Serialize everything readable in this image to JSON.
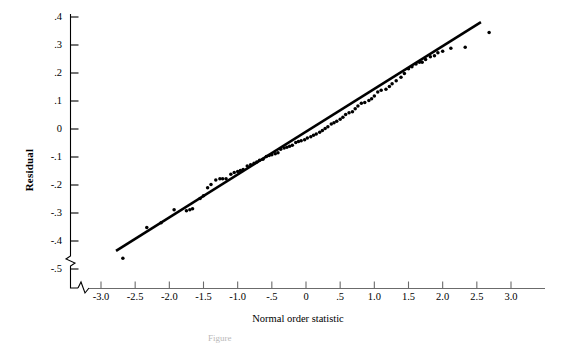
{
  "figure": {
    "ylabel": "Residual",
    "xlabel": "Normal order statistic",
    "caption": "Figure"
  },
  "chart_data": {
    "type": "scatter",
    "title": "",
    "xlabel": "Normal order statistic",
    "ylabel": "Residual",
    "xlim": [
      -3.15,
      3.0
    ],
    "ylim": [
      -0.55,
      0.45
    ],
    "xticks": [
      "-3.0",
      "-2.5",
      "-2.0",
      "-1.5",
      "-1.0",
      "-.5",
      "0",
      ".5",
      "1.0",
      "1.5",
      "2.0",
      "2.5",
      "3.0"
    ],
    "xtick_values": [
      -3.0,
      -2.5,
      -2.0,
      -1.5,
      -1.0,
      -0.5,
      0,
      0.5,
      1.0,
      1.5,
      2.0,
      2.5,
      3.0
    ],
    "yticks": [
      ".4",
      ".3",
      ".2",
      ".1",
      "0",
      "-.1",
      "-.2",
      "-.3",
      "-.4",
      "-.5"
    ],
    "ytick_values": [
      0.4,
      0.3,
      0.2,
      0.1,
      0,
      -0.1,
      -0.2,
      -0.3,
      -0.4,
      -0.5
    ],
    "grid": false,
    "legend": false,
    "axis_break_x": true,
    "axis_break_y": true,
    "marker": "filled-circle",
    "marker_color": "#000000",
    "reference_line": {
      "label": "fitted normal probability line",
      "color": "#000000",
      "x_start": -2.78,
      "y_start": -0.435,
      "x_end": 2.56,
      "y_end": 0.382
    },
    "points": [
      {
        "x": -2.68,
        "y": -0.462
      },
      {
        "x": -2.33,
        "y": -0.352
      },
      {
        "x": -2.12,
        "y": -0.335
      },
      {
        "x": -1.93,
        "y": -0.288
      },
      {
        "x": -1.75,
        "y": -0.292
      },
      {
        "x": -1.7,
        "y": -0.288
      },
      {
        "x": -1.66,
        "y": -0.285
      },
      {
        "x": -1.55,
        "y": -0.248
      },
      {
        "x": -1.5,
        "y": -0.238
      },
      {
        "x": -1.44,
        "y": -0.21
      },
      {
        "x": -1.39,
        "y": -0.198
      },
      {
        "x": -1.32,
        "y": -0.182
      },
      {
        "x": -1.26,
        "y": -0.178
      },
      {
        "x": -1.22,
        "y": -0.178
      },
      {
        "x": -1.17,
        "y": -0.178
      },
      {
        "x": -1.1,
        "y": -0.162
      },
      {
        "x": -1.05,
        "y": -0.155
      },
      {
        "x": -1.0,
        "y": -0.152
      },
      {
        "x": -0.96,
        "y": -0.148
      },
      {
        "x": -0.92,
        "y": -0.145
      },
      {
        "x": -0.86,
        "y": -0.132
      },
      {
        "x": -0.81,
        "y": -0.128
      },
      {
        "x": -0.76,
        "y": -0.122
      },
      {
        "x": -0.72,
        "y": -0.118
      },
      {
        "x": -0.68,
        "y": -0.112
      },
      {
        "x": -0.63,
        "y": -0.108
      },
      {
        "x": -0.58,
        "y": -0.098
      },
      {
        "x": -0.54,
        "y": -0.095
      },
      {
        "x": -0.5,
        "y": -0.092
      },
      {
        "x": -0.45,
        "y": -0.088
      },
      {
        "x": -0.41,
        "y": -0.085
      },
      {
        "x": -0.37,
        "y": -0.072
      },
      {
        "x": -0.32,
        "y": -0.068
      },
      {
        "x": -0.28,
        "y": -0.065
      },
      {
        "x": -0.24,
        "y": -0.062
      },
      {
        "x": -0.2,
        "y": -0.058
      },
      {
        "x": -0.15,
        "y": -0.048
      },
      {
        "x": -0.11,
        "y": -0.045
      },
      {
        "x": -0.07,
        "y": -0.042
      },
      {
        "x": -0.02,
        "y": -0.038
      },
      {
        "x": 0.02,
        "y": -0.032
      },
      {
        "x": 0.07,
        "y": -0.028
      },
      {
        "x": 0.11,
        "y": -0.022
      },
      {
        "x": 0.15,
        "y": -0.018
      },
      {
        "x": 0.2,
        "y": -0.012
      },
      {
        "x": 0.24,
        "y": -0.005
      },
      {
        "x": 0.28,
        "y": 0.002
      },
      {
        "x": 0.32,
        "y": 0.008
      },
      {
        "x": 0.37,
        "y": 0.018
      },
      {
        "x": 0.41,
        "y": 0.022
      },
      {
        "x": 0.45,
        "y": 0.028
      },
      {
        "x": 0.5,
        "y": 0.035
      },
      {
        "x": 0.54,
        "y": 0.042
      },
      {
        "x": 0.58,
        "y": 0.052
      },
      {
        "x": 0.63,
        "y": 0.058
      },
      {
        "x": 0.68,
        "y": 0.062
      },
      {
        "x": 0.72,
        "y": 0.072
      },
      {
        "x": 0.76,
        "y": 0.082
      },
      {
        "x": 0.81,
        "y": 0.092
      },
      {
        "x": 0.86,
        "y": 0.095
      },
      {
        "x": 0.92,
        "y": 0.102
      },
      {
        "x": 0.96,
        "y": 0.108
      },
      {
        "x": 1.0,
        "y": 0.118
      },
      {
        "x": 1.05,
        "y": 0.132
      },
      {
        "x": 1.1,
        "y": 0.138
      },
      {
        "x": 1.17,
        "y": 0.142
      },
      {
        "x": 1.22,
        "y": 0.152
      },
      {
        "x": 1.26,
        "y": 0.162
      },
      {
        "x": 1.32,
        "y": 0.172
      },
      {
        "x": 1.39,
        "y": 0.185
      },
      {
        "x": 1.44,
        "y": 0.198
      },
      {
        "x": 1.5,
        "y": 0.215
      },
      {
        "x": 1.55,
        "y": 0.222
      },
      {
        "x": 1.61,
        "y": 0.232
      },
      {
        "x": 1.66,
        "y": 0.238
      },
      {
        "x": 1.7,
        "y": 0.238
      },
      {
        "x": 1.75,
        "y": 0.248
      },
      {
        "x": 1.82,
        "y": 0.258
      },
      {
        "x": 1.88,
        "y": 0.262
      },
      {
        "x": 1.93,
        "y": 0.272
      },
      {
        "x": 2.0,
        "y": 0.278
      },
      {
        "x": 2.12,
        "y": 0.288
      },
      {
        "x": 2.33,
        "y": 0.292
      },
      {
        "x": 2.68,
        "y": 0.345
      }
    ]
  }
}
